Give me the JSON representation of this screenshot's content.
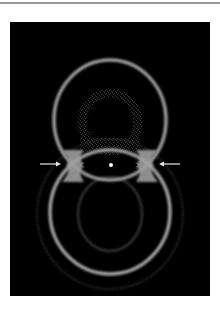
{
  "figure": {
    "background_color": "#000000",
    "ring_color": "#9c9c9c",
    "annotations": {
      "left_arrow": {
        "direction": "right",
        "color": "#e6e6e6"
      },
      "right_arrow": {
        "direction": "left",
        "color": "#e6e6e6"
      },
      "center_dot": {
        "color": "#ffffff"
      }
    }
  }
}
